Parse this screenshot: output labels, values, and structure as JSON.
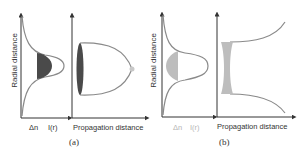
{
  "figure": {
    "panels": [
      {
        "id": "a",
        "caption": "(a)",
        "y_axis_label": "Radial distance",
        "x_labels_left": [
          "Δn",
          "I(r)"
        ],
        "x_label_right": "Propagation distance",
        "description": "Gaussian intensity profile I(r) with dark-shaded refractive index change Δn; beam converges to a focus along propagation distance (self-focusing)"
      },
      {
        "id": "b",
        "caption": "(b)",
        "y_axis_label": "Radial distance",
        "x_labels_left": [
          "Δn",
          "I(r)"
        ],
        "x_label_right": "Propagation distance",
        "description": "Gaussian intensity profile I(r) with light-shaded Δn; beam diverges along propagation distance (self-defocusing)"
      }
    ],
    "colors": {
      "axis": "#333333",
      "curve": "#8a8a8a",
      "fill_dark": "#4a4a4a",
      "fill_light": "#bdbdbd",
      "focus_dot": "#c8c8c8",
      "faint_text": "#b5b5b5"
    }
  }
}
